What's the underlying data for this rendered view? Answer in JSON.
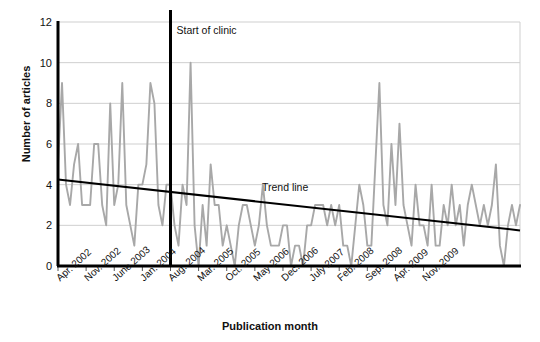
{
  "chart_data": {
    "type": "line",
    "title": "",
    "xlabel": "Publication month",
    "ylabel": "Number of articles",
    "ylim": [
      0,
      12
    ],
    "yticks": [
      0,
      2,
      4,
      6,
      8,
      10,
      12
    ],
    "grid": true,
    "legend": "none",
    "x_tick_labels": [
      "Apr. 2002",
      "Nov. 2002",
      "June 2003",
      "Jan. 2004",
      "Aug. 2004",
      "Mar. 2005",
      "Oct. 2005",
      "May 2006",
      "Dec. 2006",
      "July 2007",
      "Feb. 2008",
      "Sep. 2008",
      "Apr. 2009",
      "Nov. 2009"
    ],
    "x_tick_index": [
      0,
      7,
      14,
      21,
      28,
      35,
      42,
      49,
      56,
      63,
      70,
      77,
      84,
      91
    ],
    "x_start": "Apr. 2002",
    "x_end": "Dec. 2009",
    "n_points": 94,
    "series": [
      {
        "name": "Number of articles",
        "color": "#a8a8a8",
        "values": [
          5,
          9,
          4,
          3,
          5,
          6,
          3,
          3,
          3,
          6,
          6,
          3,
          2,
          8,
          3,
          4,
          9,
          3,
          2,
          1,
          4,
          4,
          5,
          9,
          8,
          3,
          2,
          4,
          4,
          2,
          1,
          4,
          3,
          10,
          2,
          0,
          3,
          1,
          5,
          3,
          3,
          1,
          2,
          1,
          0,
          2,
          3,
          3,
          2,
          1,
          2,
          4,
          2,
          1,
          1,
          1,
          2,
          2,
          0,
          1,
          1,
          0,
          2,
          2,
          3,
          3,
          3,
          2,
          3,
          2,
          3,
          1,
          1,
          0,
          2,
          4,
          3,
          1,
          1,
          5,
          9,
          3,
          2,
          6,
          3,
          7,
          3,
          2,
          1,
          4,
          2,
          2,
          1,
          4,
          1,
          1,
          3,
          2,
          4,
          2,
          3,
          1,
          3,
          4,
          3,
          2,
          3,
          2,
          3,
          5,
          1,
          0,
          2,
          3,
          2,
          3
        ]
      }
    ],
    "annotations": [
      {
        "name": "start-of-clinic",
        "label": "Start of clinic",
        "type": "vline",
        "x_index": 28,
        "color": "#000000"
      },
      {
        "name": "trend-line",
        "label": "Trend line",
        "type": "trend",
        "y_start": 4.25,
        "y_end": 1.75,
        "color": "#000000"
      }
    ]
  },
  "colors": {
    "series": "#a8a8a8",
    "trend": "#000000",
    "axis": "#000000",
    "grid": "#cfcfcf",
    "background": "#ffffff"
  }
}
